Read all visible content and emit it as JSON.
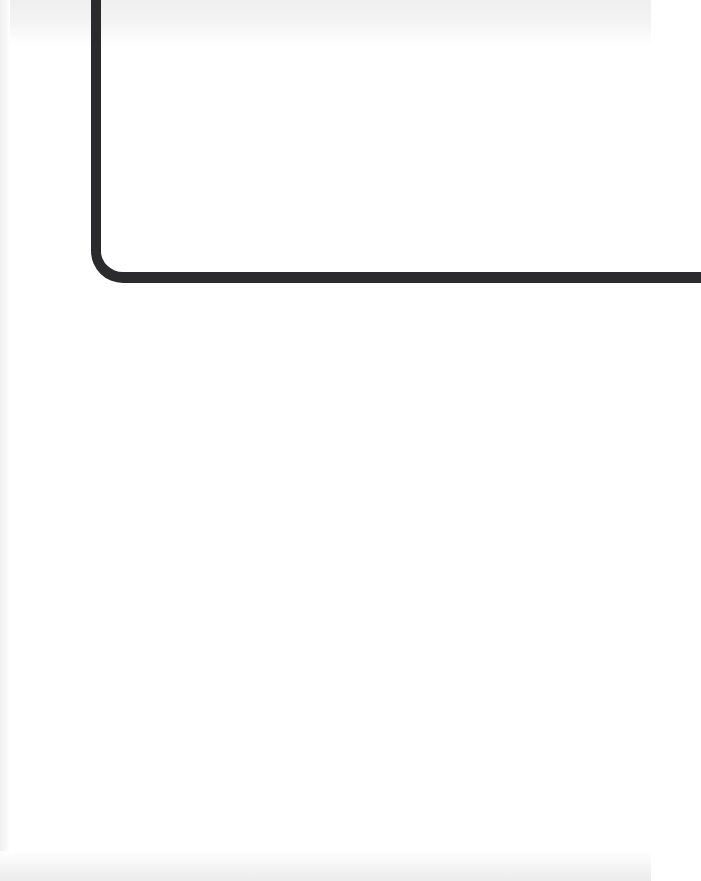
{
  "figure": {
    "line_color": "#2b2b2d",
    "background_color": "#ffffff"
  }
}
